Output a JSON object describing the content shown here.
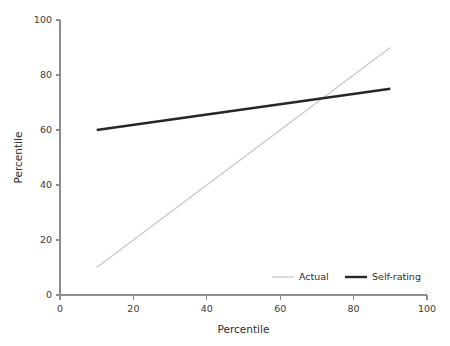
{
  "chart_data": {
    "type": "line",
    "title": "",
    "xlabel": "Percentile",
    "ylabel": "Percentile",
    "xlim": [
      0,
      100
    ],
    "ylim": [
      0,
      100
    ],
    "xticks": [
      0,
      20,
      40,
      60,
      80,
      100
    ],
    "yticks": [
      0,
      20,
      40,
      60,
      80,
      100
    ],
    "xtick_labels": [
      "0",
      "20",
      "40",
      "60",
      "80",
      "100"
    ],
    "ytick_labels": [
      "0",
      "20",
      "40",
      "60",
      "80",
      "100"
    ],
    "grid": false,
    "legend_position": "bottom-right-inside",
    "series": [
      {
        "name": "Actual",
        "color": "#c9c9c9",
        "width": 1.3,
        "x": [
          10,
          90
        ],
        "values": [
          10,
          90
        ]
      },
      {
        "name": "Self-rating",
        "color": "#262626",
        "width": 2.4,
        "x": [
          10,
          90
        ],
        "values": [
          60,
          75
        ]
      }
    ],
    "annotations": []
  },
  "legend": {
    "entries": [
      {
        "label": "Actual"
      },
      {
        "label": "Self-rating"
      }
    ]
  },
  "axes": {
    "x_title": "Percentile",
    "y_title": "Percentile"
  }
}
